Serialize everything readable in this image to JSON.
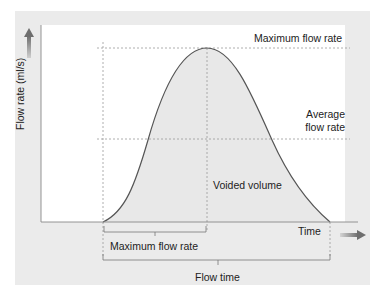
{
  "diagram": {
    "title": "",
    "y_axis_label": "Flow rate (ml/s)",
    "x_axis_label": "Time",
    "annotations": {
      "max_flow_rate_line": "Maximum flow rate",
      "average_flow_rate_line_1": "Average",
      "average_flow_rate_line_2": "flow rate",
      "area_label": "Voided volume",
      "time_to_max_bracket": "Maximum flow rate",
      "flow_time_bracket": "Flow time"
    },
    "colors": {
      "panel_bg": "#ebebeb",
      "plot_bg": "#ffffff",
      "area_fill": "#e6e6e6",
      "curve": "#555555",
      "axis": "#888888",
      "dashed": "#9a9a9a",
      "arrow": "#777777"
    },
    "icons": {
      "y_arrow": "arrow-up-icon",
      "x_arrow": "arrow-right-icon"
    }
  }
}
